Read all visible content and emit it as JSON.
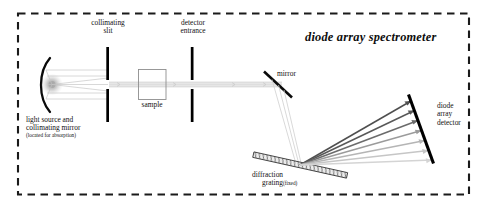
{
  "figure": {
    "title": "diode array spectrometer",
    "border_style": "dashed",
    "border_color": "#1a1a1a",
    "background": "#ffffff"
  },
  "labels": {
    "collimating_slit_line1": "collimating",
    "collimating_slit_line2": "slit",
    "detector_entrance_line1": "detector",
    "detector_entrance_line2": "entrance",
    "sample": "sample",
    "light_source_line1": "light source and",
    "light_source_line2": "collimating mirror",
    "light_source_note": "(located for absorption)",
    "mirror": "mirror",
    "diffraction_line1": "diffraction",
    "diffraction_line2": "grating",
    "diffraction_note": "(fixed)",
    "detector_line1": "diode",
    "detector_line2": "array",
    "detector_line3": "detector"
  },
  "colors": {
    "ink": "#111111",
    "component_black": "#000000",
    "beam_gray": "#c9c9c9",
    "glow": "#bdbdbd",
    "grating_fill": "#e8e8e8",
    "ray_darkest": "#4a4a4a",
    "ray_lightest": "#d8d8d8"
  },
  "components": [
    {
      "name": "collimating-mirror",
      "type": "concave-arc"
    },
    {
      "name": "light-source",
      "type": "glow-spot"
    },
    {
      "name": "collimating-slit",
      "type": "vertical-bar-pair"
    },
    {
      "name": "sample-cell",
      "type": "open-square"
    },
    {
      "name": "detector-entrance-slit",
      "type": "vertical-bar-pair"
    },
    {
      "name": "fold-mirror",
      "type": "tilted-bar"
    },
    {
      "name": "diffraction-grating",
      "type": "hatched-bar"
    },
    {
      "name": "diode-array-detector",
      "type": "tilted-bar"
    }
  ],
  "rays": {
    "collimated_beam_count": 5,
    "dispersed_fan_count": 7,
    "fan_shades": [
      "#4f4f4f",
      "#5c5c5c",
      "#6e6e6e",
      "#9a9a9a",
      "#b4b4b4",
      "#c4c4c4",
      "#d2d2d2"
    ]
  }
}
